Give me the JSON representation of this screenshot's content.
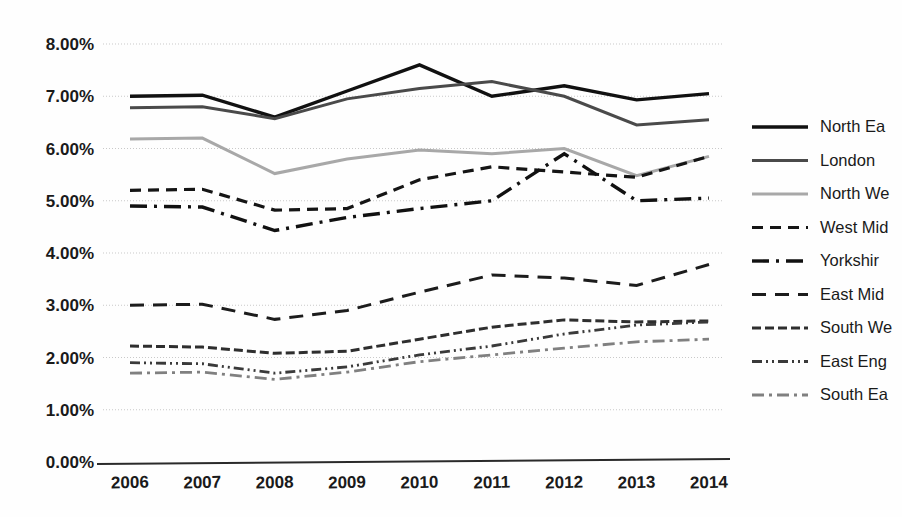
{
  "chart_data": {
    "type": "line",
    "title": "",
    "subtitle": "",
    "xlabel": "",
    "ylabel": "",
    "categories": [
      "2006",
      "2007",
      "2008",
      "2009",
      "2010",
      "2011",
      "2012",
      "2013",
      "2014"
    ],
    "x": [
      2006,
      2007,
      2008,
      2009,
      2010,
      2011,
      2012,
      2013,
      2014
    ],
    "ylim": [
      0,
      8
    ],
    "ytick_values": [
      0,
      1,
      2,
      3,
      4,
      5,
      6,
      7,
      8
    ],
    "ytick_labels": [
      "0.00%",
      "1.00%",
      "2.00%",
      "3.00%",
      "4.00%",
      "5.00%",
      "6.00%",
      "7.00%",
      "8.00%"
    ],
    "grid": true,
    "grid_axis": "y",
    "legend_position": "right",
    "value_suffix": "%",
    "series": [
      {
        "name": "North Ea",
        "values": [
          7.0,
          7.02,
          6.6,
          7.1,
          7.6,
          7.0,
          7.2,
          6.93,
          7.05
        ],
        "style": "solid",
        "color": "#111111",
        "width": 3.4,
        "dash": ""
      },
      {
        "name": "London",
        "values": [
          6.78,
          6.8,
          6.57,
          6.95,
          7.15,
          7.28,
          7.0,
          6.45,
          6.55
        ],
        "style": "solid",
        "color": "#4a4a4a",
        "width": 3.0,
        "dash": ""
      },
      {
        "name": "North We",
        "values": [
          6.18,
          6.2,
          5.52,
          5.8,
          5.97,
          5.9,
          6.0,
          5.48,
          5.85
        ],
        "style": "solid",
        "color": "#a8a8a8",
        "width": 3.0,
        "dash": ""
      },
      {
        "name": "West Mid",
        "values": [
          5.2,
          5.22,
          4.82,
          4.85,
          5.4,
          5.65,
          5.55,
          5.45,
          5.85
        ],
        "style": "dashed",
        "color": "#151515",
        "width": 3.2,
        "dash": "11 7"
      },
      {
        "name": "Yorkshir",
        "values": [
          4.9,
          4.88,
          4.43,
          4.68,
          4.85,
          5.0,
          5.9,
          5.0,
          5.05
        ],
        "style": "dash-dot",
        "color": "#111111",
        "width": 3.4,
        "dash": "17 7 3 7"
      },
      {
        "name": "East Mid",
        "values": [
          3.0,
          3.02,
          2.73,
          2.9,
          3.25,
          3.58,
          3.52,
          3.38,
          3.78
        ],
        "style": "dashed-medium",
        "color": "#1c1c1c",
        "width": 3.0,
        "dash": "14 9"
      },
      {
        "name": "South We",
        "values": [
          2.22,
          2.2,
          2.08,
          2.12,
          2.35,
          2.58,
          2.72,
          2.68,
          2.7
        ],
        "style": "long-dash",
        "color": "#2e2e2e",
        "width": 3.0,
        "dash": "9 4"
      },
      {
        "name": "East Eng",
        "values": [
          1.9,
          1.88,
          1.7,
          1.82,
          2.05,
          2.22,
          2.45,
          2.62,
          2.68
        ],
        "style": "dash-dot-dot",
        "color": "#3a3a3a",
        "width": 2.8,
        "dash": "10 4 2 4 2 4"
      },
      {
        "name": "South Ea",
        "values": [
          1.7,
          1.72,
          1.58,
          1.72,
          1.92,
          2.05,
          2.18,
          2.3,
          2.35
        ],
        "style": "light-dash-dot",
        "color": "#808080",
        "width": 2.8,
        "dash": "12 5 3 5"
      }
    ]
  },
  "legend": {
    "entries": [
      {
        "label": "North Ea"
      },
      {
        "label": "London"
      },
      {
        "label": "North We"
      },
      {
        "label": "West Mid"
      },
      {
        "label": "Yorkshir"
      },
      {
        "label": "East Mid"
      },
      {
        "label": "South We"
      },
      {
        "label": "East Eng"
      },
      {
        "label": "South Ea"
      }
    ]
  }
}
